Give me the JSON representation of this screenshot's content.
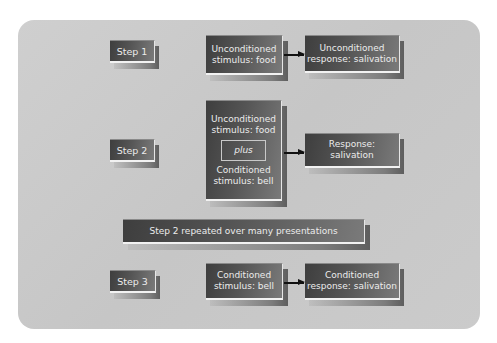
{
  "diagram": {
    "colors": {
      "panel": "#c8c8c8",
      "box_dark": "#3e3e3e",
      "box_light": "#7a7a7a",
      "text": "#ececec",
      "arrow": "#111111"
    },
    "step1": {
      "label": "Step 1",
      "stimulus": [
        "Unconditioned",
        "stimulus: food"
      ],
      "response": [
        "Unconditioned",
        "response: salivation"
      ]
    },
    "step2": {
      "label": "Step 2",
      "stimulus_top": [
        "Unconditioned",
        "stimulus: food"
      ],
      "plus": "plus",
      "stimulus_bottom": [
        "Conditioned",
        "stimulus: bell"
      ],
      "response": [
        "Response:",
        "salivation"
      ]
    },
    "repeat_banner": "Step 2 repeated over many presentations",
    "step3": {
      "label": "Step 3",
      "stimulus": [
        "Conditioned",
        "stimulus: bell"
      ],
      "response": [
        "Conditioned",
        "response: salivation"
      ]
    }
  }
}
